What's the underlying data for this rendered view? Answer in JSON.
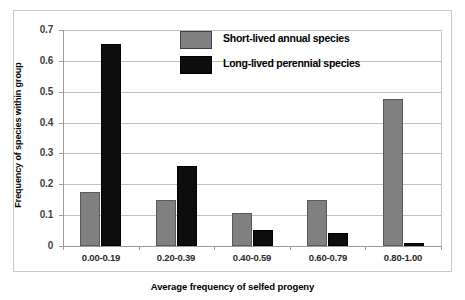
{
  "chart_data": {
    "type": "bar",
    "title": "",
    "xlabel": "Average frequency of selfed progeny",
    "ylabel": "Frequency of species within group",
    "categories": [
      "0.00-0.19",
      "0.20-0.39",
      "0.40-0.59",
      "0.60-0.79",
      "0.80-1.00"
    ],
    "series": [
      {
        "name": "Short-lived annual species",
        "color": "#808080",
        "values": [
          0.175,
          0.148,
          0.108,
          0.148,
          0.475
        ]
      },
      {
        "name": "Long-lived perennial species",
        "color": "#0d0d0d",
        "values": [
          0.655,
          0.26,
          0.053,
          0.042,
          0.01
        ]
      }
    ],
    "ylim": [
      0,
      0.7
    ],
    "yticks": [
      "0",
      "0.1",
      "0.2",
      "0.3",
      "0.4",
      "0.5",
      "0.6",
      "0.7"
    ],
    "ytick_values": [
      0,
      0.1,
      0.2,
      0.3,
      0.4,
      0.5,
      0.6,
      0.7
    ],
    "grid": true,
    "legend_position": "top-center"
  }
}
